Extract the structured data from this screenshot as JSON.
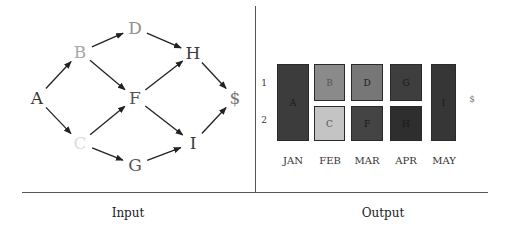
{
  "input_panel": {
    "caption": "Input",
    "nodes": [
      {
        "id": "A",
        "label": "A",
        "x": 37,
        "y": 98,
        "color": "#333333"
      },
      {
        "id": "B",
        "label": "B",
        "x": 80,
        "y": 52,
        "color": "#a8a8a8"
      },
      {
        "id": "C",
        "label": "C",
        "x": 80,
        "y": 143,
        "color": "#dcdcdc"
      },
      {
        "id": "D",
        "label": "D",
        "x": 135,
        "y": 28,
        "color": "#909090"
      },
      {
        "id": "F",
        "label": "F",
        "x": 135,
        "y": 98,
        "color": "#555555"
      },
      {
        "id": "G",
        "label": "G",
        "x": 135,
        "y": 165,
        "color": "#555555"
      },
      {
        "id": "H",
        "label": "H",
        "x": 193,
        "y": 53,
        "color": "#3a3a3a"
      },
      {
        "id": "I",
        "label": "I",
        "x": 193,
        "y": 143,
        "color": "#3a3a3a"
      },
      {
        "id": "S",
        "label": "$",
        "x": 235,
        "y": 98,
        "color": "#777777"
      }
    ],
    "edges": [
      [
        "A",
        "B"
      ],
      [
        "A",
        "C"
      ],
      [
        "B",
        "D"
      ],
      [
        "B",
        "F"
      ],
      [
        "C",
        "F"
      ],
      [
        "C",
        "G"
      ],
      [
        "D",
        "H"
      ],
      [
        "F",
        "H"
      ],
      [
        "F",
        "I"
      ],
      [
        "G",
        "I"
      ],
      [
        "H",
        "S"
      ],
      [
        "I",
        "S"
      ]
    ]
  },
  "output_panel": {
    "caption": "Output",
    "row_labels": [
      "1",
      "2"
    ],
    "months": [
      "JAN",
      "FEB",
      "MAR",
      "APR",
      "MAY"
    ],
    "blocks": [
      {
        "label": "A",
        "month": "JAN",
        "rows": "1-2",
        "color": "#3c3c3c"
      },
      {
        "label": "B",
        "month": "FEB",
        "rows": "1",
        "color": "#8a8a8a"
      },
      {
        "label": "C",
        "month": "FEB",
        "rows": "2",
        "color": "#c4c4c4"
      },
      {
        "label": "D",
        "month": "MAR",
        "rows": "1",
        "color": "#777777"
      },
      {
        "label": "F",
        "month": "MAR",
        "rows": "2",
        "color": "#444444"
      },
      {
        "label": "G",
        "month": "APR",
        "rows": "1",
        "color": "#3e3e3e"
      },
      {
        "label": "H",
        "month": "APR",
        "rows": "2",
        "color": "#2e2e2e"
      },
      {
        "label": "I",
        "month": "MAY",
        "rows": "1-2",
        "color": "#363636"
      }
    ],
    "sink_label": "$"
  }
}
